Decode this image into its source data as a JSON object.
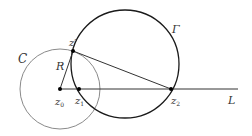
{
  "diagram": {
    "circle_C": {
      "label": "C",
      "color": "#888888",
      "cx": 60,
      "cy": 89,
      "r": 40
    },
    "circle_Gamma": {
      "label": "Γ",
      "color": "#222222",
      "cx": 125,
      "cy": 64,
      "r": 54
    },
    "line_L": {
      "label": "L",
      "x1": 60,
      "y1": 89,
      "x2": 238,
      "y2": 89
    },
    "points": [
      {
        "id": "z0",
        "label": "z",
        "sub": "0",
        "x": 60,
        "y": 89
      },
      {
        "id": "z1",
        "label": "z",
        "sub": "1",
        "x": 79,
        "y": 89
      },
      {
        "id": "z2",
        "label": "z",
        "sub": "2",
        "x": 171,
        "y": 89
      },
      {
        "id": "zprime",
        "label": "z′",
        "x": 73,
        "y": 51
      }
    ],
    "segment_R": {
      "label": "R"
    }
  }
}
